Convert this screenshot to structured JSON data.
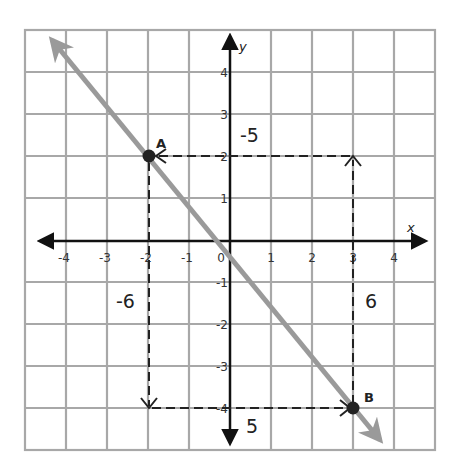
{
  "diagram": {
    "type": "coordinate-plane",
    "grid": {
      "x_min": -5,
      "x_max": 5,
      "y_min": -5,
      "y_max": 5
    },
    "axis_labels": {
      "x": "x",
      "y": "y"
    },
    "x_ticks": [
      "-4",
      "-3",
      "-2",
      "-1",
      "0",
      "1",
      "2",
      "3",
      "4"
    ],
    "y_ticks": [
      "4",
      "3",
      "2",
      "1",
      "-1",
      "-2",
      "-3",
      "-4"
    ],
    "points": [
      {
        "label": "A",
        "x": -2,
        "y": 2
      },
      {
        "label": "B",
        "x": 3,
        "y": -4
      }
    ],
    "line": {
      "through": [
        "A",
        "B"
      ],
      "slope": "-6/5",
      "color": "#9a9a9a"
    },
    "annotations": {
      "rise_left": "-6",
      "run_bottom": "5",
      "run_top": "-5",
      "rise_right": "6"
    },
    "colors": {
      "grid": "#a8a8a8",
      "axes": "#111111",
      "line": "#9a9a9a",
      "dashed": "#222222",
      "point": "#222222"
    }
  }
}
